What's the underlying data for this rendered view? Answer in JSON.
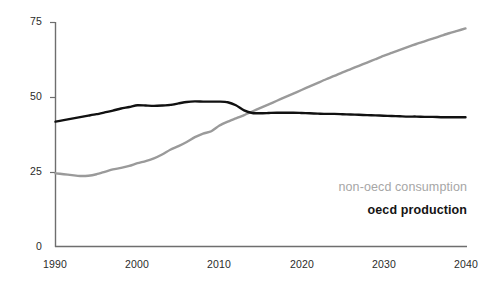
{
  "chart_data": {
    "type": "line",
    "title": "",
    "subtitle": "",
    "xlabel": "",
    "ylabel": "",
    "xlim": [
      1990,
      2040
    ],
    "ylim": [
      0,
      75
    ],
    "grid": false,
    "legend_position": "inside-right",
    "x_ticks": [
      "1990",
      "2000",
      "2010",
      "2020",
      "2030",
      "2040"
    ],
    "x_tick_values": [
      1990,
      2000,
      2010,
      2020,
      2030,
      2040
    ],
    "y_ticks": [
      "0",
      "25",
      "50",
      "75"
    ],
    "y_tick_values": [
      0,
      25,
      50,
      75
    ],
    "x": [
      1990,
      1991,
      1992,
      1993,
      1994,
      1995,
      1996,
      1997,
      1998,
      1999,
      2000,
      2001,
      2002,
      2003,
      2004,
      2005,
      2006,
      2007,
      2008,
      2009,
      2010,
      2011,
      2012,
      2013,
      2014,
      2015,
      2016,
      2017,
      2018,
      2019,
      2020,
      2021,
      2022,
      2023,
      2024,
      2025,
      2026,
      2027,
      2028,
      2029,
      2030,
      2031,
      2032,
      2033,
      2034,
      2035,
      2036,
      2037,
      2038,
      2039,
      2040
    ],
    "series": [
      {
        "name": "non-oecd consumption",
        "color": "#9a9a9a",
        "values": [
          24.5,
          24.2,
          23.9,
          23.6,
          23.7,
          24.2,
          25.0,
          25.8,
          26.3,
          27.0,
          27.9,
          28.6,
          29.5,
          30.8,
          32.4,
          33.6,
          35.0,
          36.6,
          37.8,
          38.6,
          40.5,
          41.8,
          42.9,
          44.0,
          45.2,
          46.4,
          47.6,
          48.8,
          50.0,
          51.2,
          52.4,
          53.6,
          54.8,
          56.0,
          57.1,
          58.3,
          59.4,
          60.5,
          61.6,
          62.7,
          63.8,
          64.8,
          65.8,
          66.8,
          67.8,
          68.7,
          69.6,
          70.5,
          71.4,
          72.2,
          73.0
        ]
      },
      {
        "name": "oecd production",
        "color": "#111111",
        "values": [
          41.8,
          42.3,
          42.8,
          43.3,
          43.8,
          44.3,
          44.9,
          45.5,
          46.2,
          46.7,
          47.3,
          47.2,
          47.1,
          47.2,
          47.4,
          47.9,
          48.4,
          48.6,
          48.5,
          48.5,
          48.5,
          48.3,
          47.3,
          45.6,
          44.7,
          44.6,
          44.7,
          44.8,
          44.8,
          44.8,
          44.7,
          44.6,
          44.5,
          44.4,
          44.4,
          44.3,
          44.2,
          44.1,
          44.0,
          43.9,
          43.8,
          43.7,
          43.6,
          43.5,
          43.5,
          43.4,
          43.4,
          43.3,
          43.3,
          43.3,
          43.3
        ]
      }
    ],
    "annotations": [
      {
        "text": "non-oecd consumption",
        "color": "#a6a6a6"
      },
      {
        "text": "oecd production",
        "color": "#141414"
      }
    ]
  },
  "axes": {
    "y_tick_0": "0",
    "y_tick_25": "25",
    "y_tick_50": "50",
    "y_tick_75": "75",
    "x_tick_1990": "1990",
    "x_tick_2000": "2000",
    "x_tick_2010": "2010",
    "x_tick_2020": "2020",
    "x_tick_2030": "2030",
    "x_tick_2040": "2040"
  },
  "legend": {
    "nonoecd": "non-oecd consumption",
    "oecd": "oecd production"
  },
  "colors": {
    "nonoecd_line": "#9a9a9a",
    "oecd_line": "#111111",
    "axis": "#6e6e6e",
    "text": "#2b2b2b"
  }
}
